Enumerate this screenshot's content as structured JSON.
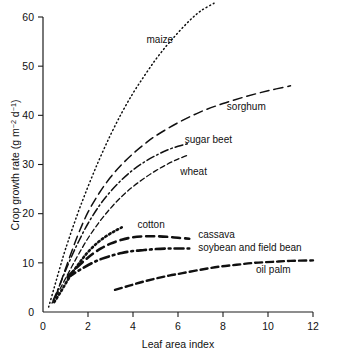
{
  "chart_data": {
    "type": "line",
    "title": "",
    "xlabel": "Leaf area index",
    "ylabel": "Crop growth rate (g m-2 d-1)",
    "ylabel_parts": {
      "prefix": "Crop growth rate (g m",
      "sup1": "−2",
      "mid": " d",
      "sup2": "−1",
      "suffix": ")"
    },
    "xlim": [
      0,
      12
    ],
    "ylim": [
      0,
      62
    ],
    "xticks": [
      "0",
      "2",
      "4",
      "6",
      "8",
      "10",
      "12"
    ],
    "xtick_values": [
      0,
      2,
      4,
      6,
      8,
      10,
      12
    ],
    "yticks": [
      "0",
      "10",
      "20",
      "30",
      "40",
      "50",
      "60"
    ],
    "ytick_values": [
      0,
      10,
      20,
      30,
      40,
      50,
      60
    ],
    "grid": false,
    "legend_position": "inline-labels",
    "series": [
      {
        "name": "maize",
        "label": "maize",
        "linestyle": "fine-dotted",
        "dash": "1,3",
        "width": 1.5,
        "label_x": 4.6,
        "label_y": 55.5,
        "x": [
          0.25,
          0.5,
          0.75,
          1.0,
          1.5,
          2.0,
          2.5,
          3.0,
          3.5,
          4.0,
          4.5,
          5.0,
          5.5,
          6.0,
          6.5,
          7.0,
          7.6
        ],
        "y": [
          1.0,
          5.0,
          9.0,
          12.8,
          19.5,
          25.5,
          31.0,
          36.0,
          40.5,
          44.5,
          48.0,
          51.3,
          54.2,
          56.8,
          59.2,
          61.2,
          62.8
        ]
      },
      {
        "name": "sorghum",
        "label": "sorghum",
        "linestyle": "long-dash",
        "dash": "9,5",
        "width": 1.5,
        "label_x": 9.9,
        "label_y": 41.8,
        "x": [
          0.55,
          0.8,
          1.0,
          1.3,
          1.6,
          2.0,
          2.5,
          3.0,
          3.5,
          4.0,
          4.5,
          5.0,
          6.0,
          7.0,
          8.0,
          9.0,
          10.0,
          11.0
        ],
        "y": [
          3.0,
          6.2,
          8.8,
          12.6,
          16.2,
          20.3,
          24.2,
          27.4,
          30.0,
          32.2,
          34.1,
          35.8,
          38.5,
          40.7,
          42.4,
          43.8,
          45.0,
          46.0
        ]
      },
      {
        "name": "sugar beet",
        "label": "sugar beet",
        "linestyle": "dash-dot",
        "dash": "8,3,1.6,3",
        "width": 1.5,
        "label_x": 6.3,
        "label_y": 35.0,
        "x": [
          0.45,
          0.7,
          1.0,
          1.3,
          1.6,
          2.0,
          2.5,
          3.0,
          3.5,
          4.0,
          4.5,
          5.0,
          5.5,
          6.0,
          6.5
        ],
        "y": [
          2.4,
          5.0,
          8.4,
          11.6,
          14.5,
          18.0,
          21.6,
          24.5,
          26.9,
          28.9,
          30.5,
          31.8,
          32.9,
          33.7,
          34.3
        ]
      },
      {
        "name": "wheat",
        "label": "wheat",
        "linestyle": "short-dash",
        "dash": "5,3",
        "width": 1.3,
        "label_x": 6.1,
        "label_y": 28.6,
        "x": [
          0.4,
          0.7,
          1.0,
          1.3,
          1.6,
          2.0,
          2.5,
          3.0,
          3.5,
          4.0,
          4.5,
          5.0,
          5.5,
          6.0,
          6.5
        ],
        "y": [
          1.8,
          4.2,
          6.8,
          9.4,
          11.9,
          15.0,
          18.3,
          21.1,
          23.5,
          25.5,
          27.2,
          28.7,
          30.0,
          31.1,
          32.0
        ]
      },
      {
        "name": "cotton",
        "label": "cotton",
        "linestyle": "thick-dotted",
        "dash": "1.6,2.8",
        "width": 2.6,
        "label_x": 4.2,
        "label_y": 17.8,
        "x": [
          0.5,
          0.8,
          1.1,
          1.4,
          1.7,
          2.0,
          2.4,
          2.8,
          3.2,
          3.5
        ],
        "y": [
          2.0,
          4.2,
          6.5,
          8.6,
          10.5,
          12.2,
          14.0,
          15.4,
          16.5,
          17.2
        ]
      },
      {
        "name": "cassava",
        "label": "cassava",
        "linestyle": "thick-dash",
        "dash": "8,5",
        "width": 2.6,
        "label_x": 6.9,
        "label_y": 15.7,
        "x": [
          1.1,
          1.4,
          1.8,
          2.2,
          2.6,
          3.0,
          3.5,
          4.0,
          4.5,
          5.0,
          5.5,
          6.0,
          6.5
        ],
        "y": [
          7.2,
          8.6,
          10.3,
          11.8,
          13.0,
          13.9,
          14.7,
          15.2,
          15.4,
          15.4,
          15.3,
          15.1,
          14.9
        ]
      },
      {
        "name": "soybean and field bean",
        "label": "soybean and field bean",
        "linestyle": "thick-dash-dot",
        "dash": "9,4,1.8,4",
        "width": 2.6,
        "label_x": 6.9,
        "label_y": 13.2,
        "x": [
          1.1,
          1.4,
          1.8,
          2.2,
          2.6,
          3.0,
          3.5,
          4.0,
          4.5,
          5.0,
          5.5,
          6.0,
          6.5
        ],
        "y": [
          7.0,
          7.9,
          9.0,
          10.0,
          10.8,
          11.4,
          12.0,
          12.4,
          12.6,
          12.8,
          12.9,
          12.9,
          12.9
        ]
      },
      {
        "name": "oil palm",
        "label": "oil palm",
        "linestyle": "thick-dash",
        "dash": "7,4",
        "width": 2.4,
        "label_x": 11.0,
        "label_y": 8.6,
        "x": [
          3.2,
          3.8,
          4.4,
          5.0,
          5.6,
          6.2,
          7.0,
          7.8,
          8.6,
          9.4,
          10.2,
          11.0,
          12.0
        ],
        "y": [
          4.5,
          5.3,
          6.1,
          6.8,
          7.4,
          7.9,
          8.6,
          9.2,
          9.6,
          10.0,
          10.2,
          10.4,
          10.5
        ]
      }
    ]
  },
  "axes": {
    "x_title": "Leaf area index",
    "y_title": "Crop growth rate (g m−2 d−1)"
  }
}
